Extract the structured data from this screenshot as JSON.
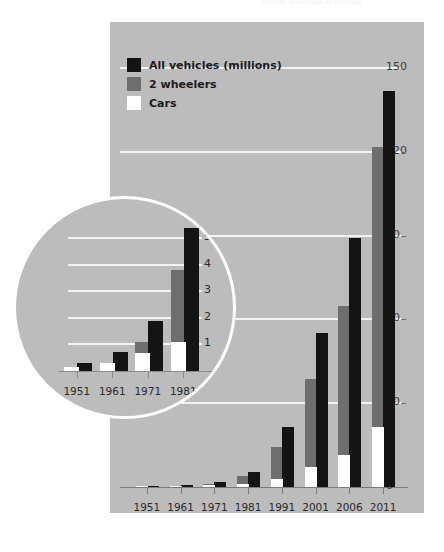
{
  "caption": {
    "text": "Growth in number of vehicles"
  },
  "colors": {
    "panel_background": "#bcbcbc",
    "gridline": "#f2f2f2",
    "all_vehicles": "#141414",
    "two_wheelers": "#6e6e6e",
    "cars": "#ffffff",
    "axis": "#7a7a7a",
    "inset_border": "#ffffff"
  },
  "legend": {
    "items": [
      {
        "label": "All vehicles (millions)",
        "color": "#141414",
        "key": "all_vehicles"
      },
      {
        "label": "2 wheelers",
        "color": "#6e6e6e",
        "key": "two_wheelers"
      },
      {
        "label": "Cars",
        "color": "#ffffff",
        "key": "cars"
      }
    ]
  },
  "chart_data": {
    "type": "bar",
    "title": "Growth in number of vehicles",
    "xlabel": "",
    "ylabel": "",
    "ylim": [
      0,
      150
    ],
    "yticks": [
      0,
      30,
      60,
      90,
      120,
      150
    ],
    "grid": true,
    "legend_position": "top-left",
    "categories": [
      "1951",
      "1961",
      "1971",
      "1981",
      "1991",
      "2001",
      "2006",
      "2011"
    ],
    "series": [
      {
        "name": "All vehicles (millions)",
        "color": "#141414",
        "values": [
          0.3,
          0.7,
          1.9,
          5.4,
          21.4,
          55.0,
          89.0,
          141.8
        ]
      },
      {
        "name": "2 wheelers",
        "color": "#6e6e6e",
        "values": [
          0.03,
          0.27,
          1.1,
          3.8,
          14.2,
          38.6,
          64.7,
          121.6
        ]
      },
      {
        "name": "Cars",
        "color": "#ffffff",
        "values": [
          0.16,
          0.31,
          0.68,
          1.1,
          3.0,
          7.1,
          11.5,
          21.5
        ]
      }
    ],
    "inset": {
      "type": "bar",
      "description": "magnified view of early years",
      "ylim": [
        0,
        5.8
      ],
      "yticks": [
        1,
        2,
        3,
        4,
        5
      ],
      "grid": true,
      "categories": [
        "1951",
        "1961",
        "1971",
        "1981"
      ],
      "series": [
        {
          "name": "All vehicles (millions)",
          "color": "#141414",
          "values": [
            0.3,
            0.7,
            1.9,
            5.4
          ]
        },
        {
          "name": "2 wheelers",
          "color": "#6e6e6e",
          "values": [
            0.03,
            0.27,
            1.1,
            3.8
          ]
        },
        {
          "name": "Cars",
          "color": "#ffffff",
          "values": [
            0.16,
            0.31,
            0.68,
            1.1
          ]
        }
      ]
    }
  }
}
